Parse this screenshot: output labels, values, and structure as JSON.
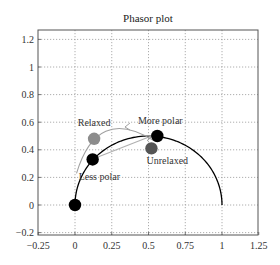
{
  "chart_data": {
    "type": "scatter",
    "title": "Phasor plot",
    "xlabel": "",
    "ylabel": "",
    "xlim": [
      -0.25,
      1.25
    ],
    "ylim": [
      -0.25,
      1.25
    ],
    "x_ticks": [
      -0.25,
      0,
      0.25,
      0.5,
      0.75,
      1,
      1.25
    ],
    "x_tick_labels": [
      "−0.25",
      "0",
      "0.25",
      "0.5",
      "0.75",
      "1",
      "1.25"
    ],
    "y_ticks": [
      -0.2,
      0,
      0.2,
      0.4,
      0.6,
      0.8,
      1,
      1.2
    ],
    "y_tick_labels": [
      "−0.2",
      "0",
      "0.2",
      "0.4",
      "0.6",
      "0.8",
      "1",
      "1.2"
    ],
    "grid": true,
    "grid_style": "dotted",
    "legend": null,
    "universal_semicircle": {
      "center": [
        0.5,
        0
      ],
      "radius": 0.5,
      "color": "#000000"
    },
    "points": [
      {
        "name": "Origin",
        "label": "",
        "x": 0.0,
        "y": 0.0,
        "color": "#000000"
      },
      {
        "name": "Less polar",
        "label": "Less polar",
        "x": 0.12,
        "y": 0.33,
        "color": "#000000"
      },
      {
        "name": "More polar",
        "label": "More polar",
        "x": 0.56,
        "y": 0.5,
        "color": "#000000"
      },
      {
        "name": "Relaxed",
        "label": "Relaxed",
        "x": 0.13,
        "y": 0.48,
        "color": "#8c8c8c"
      },
      {
        "name": "Unrelaxed",
        "label": "Unrelaxed",
        "x": 0.52,
        "y": 0.41,
        "color": "#555555"
      }
    ],
    "annotations": [
      {
        "type": "arrow",
        "from": [
          0.12,
          0.33
        ],
        "to": [
          0.52,
          0.5
        ],
        "color": "#b0b0b0",
        "description": "shift from less polar toward more polar"
      },
      {
        "type": "curved-arrow",
        "from": [
          0.53,
          0.47
        ],
        "to": [
          0.0,
          0.23
        ],
        "color": "#a0a0a0",
        "description": "relaxation arc from unrelaxed toward relaxed"
      }
    ]
  }
}
